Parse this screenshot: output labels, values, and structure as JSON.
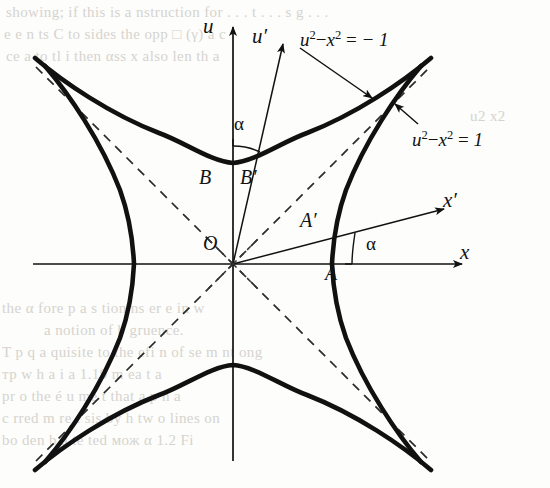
{
  "figure": {
    "kind": "hyperbola-rotation-diagram",
    "axes": [
      {
        "name": "u-axis",
        "label": "u",
        "x": 203,
        "y": 14
      },
      {
        "name": "u-prime-axis",
        "label": "u′",
        "x": 252,
        "y": 24
      },
      {
        "name": "x-axis",
        "label": "x",
        "x": 460,
        "y": 240
      },
      {
        "name": "x-prime-axis",
        "label": "x′",
        "x": 443,
        "y": 188
      }
    ],
    "points": [
      {
        "name": "origin",
        "label": "O",
        "x": 203,
        "y": 232
      },
      {
        "name": "vertex-A",
        "label": "A",
        "x": 325,
        "y": 262
      },
      {
        "name": "vertex-A-prime",
        "label": "A′",
        "x": 300,
        "y": 209
      },
      {
        "name": "vertex-B",
        "label": "B",
        "x": 199,
        "y": 166
      },
      {
        "name": "vertex-B-prime",
        "label": "B′",
        "x": 240,
        "y": 166
      }
    ],
    "angles": [
      {
        "name": "alpha-top",
        "label": "α",
        "x": 234,
        "y": 113
      },
      {
        "name": "alpha-right",
        "label": "α",
        "x": 366,
        "y": 233
      }
    ],
    "curve_labels": [
      {
        "name": "equation-upper",
        "text": "u2 - x2 = -1",
        "lhs_base": "u",
        "lhs_exp": "2",
        "minus": "−",
        "rhs_base": "x",
        "rhs_exp": "2",
        "equals": "=",
        "value": "− 1",
        "x": 300,
        "y": 28
      },
      {
        "name": "equation-right",
        "text": "u2 - x2 = 1",
        "lhs_base": "u",
        "lhs_exp": "2",
        "minus": "−",
        "rhs_base": "x",
        "rhs_exp": "2",
        "equals": "=",
        "value": "1",
        "x": 412,
        "y": 128
      }
    ]
  },
  "chart_data": {
    "type": "line",
    "title": "",
    "xlabel": "x",
    "ylabel": "u",
    "origin_px": {
      "x": 233,
      "y": 264
    },
    "scale_px_per_unit": 99,
    "curves": [
      {
        "name": "hyperbola-right",
        "equation": "u^2 - x^2 = -1",
        "vertex": [
          1,
          0
        ]
      },
      {
        "name": "hyperbola-left",
        "equation": "u^2 - x^2 = -1",
        "vertex": [
          -1,
          0
        ]
      },
      {
        "name": "hyperbola-upper",
        "equation": "u^2 - x^2 = 1",
        "vertex": [
          0,
          1
        ]
      },
      {
        "name": "hyperbola-lower",
        "equation": "u^2 - x^2 = 1",
        "vertex": [
          0,
          -1
        ]
      }
    ],
    "asymptotes": [
      "u = x",
      "u = -x"
    ],
    "rotated_axes": {
      "u_prime_angle_deg_from_u": 12.7,
      "x_prime_angle_deg_from_x": 14.6
    },
    "marked_points": {
      "A": [
        1,
        0
      ],
      "A_prime": "intersection of x' axis with u^2 - x^2 = -1",
      "B": [
        0,
        1
      ],
      "B_prime": "intersection of u' axis with u^2 - x^2 = 1"
    },
    "grid": false,
    "legend": "none"
  },
  "background_text": {
    "note": "faint show-through text from the reverse of the book page",
    "lines": [
      {
        "text": "showing; if this is a  nstruction for . . .  t . . .  s     g . . .",
        "x": 6,
        "y": 4,
        "size": 15
      },
      {
        "text": "e     e  n  ts   C   to   sides  the  opp   □  (γ)    a  c",
        "x": 4,
        "y": 26,
        "size": 15
      },
      {
        "text": "    ce  a  to    tl  i  then  αss  x  also  len   th  a",
        "x": 6,
        "y": 48,
        "size": 15
      },
      {
        "text": "u2 x2",
        "x": 470,
        "y": 108,
        "size": 15
      },
      {
        "text": "the     α  fore  p  a  s tion       ns    er   e  in    w",
        "x": 2,
        "y": 300,
        "size": 15
      },
      {
        "text": "a      notion of  b   gruence.",
        "x": 44,
        "y": 322,
        "size": 15
      },
      {
        "text": "T  p  q    a  quisite  to the  efi     n of  se  m  nt   ong",
        "x": 2,
        "y": 344,
        "size": 15
      },
      {
        "text": "тр     w    h   a  i  a  1.19    m    ea    t    a",
        "x": 2,
        "y": 366,
        "size": 15
      },
      {
        "text": "pr    o      the é  u  me  t   that  a  p  n  a",
        "x": 2,
        "y": 388,
        "size": 15
      },
      {
        "text": "c     rred  m  re  t  sis  by   h  tw  o  lines  on",
        "x": 2,
        "y": 410,
        "size": 15
      },
      {
        "text": "bo    den   b   a    te  ted   мож  α  1.2  Fi",
        "x": 2,
        "y": 432,
        "size": 15
      }
    ]
  }
}
